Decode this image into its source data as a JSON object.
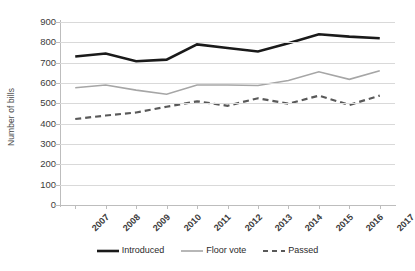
{
  "chart_data": {
    "type": "line",
    "title": "",
    "xlabel": "",
    "ylabel": "Number of bills",
    "categories": [
      "2007",
      "2008",
      "2009",
      "2010",
      "2011",
      "2012",
      "2013",
      "2014",
      "2015",
      "2016",
      "2017"
    ],
    "ylim": [
      0,
      900
    ],
    "ytick_step": 100,
    "yticks": [
      900,
      800,
      700,
      600,
      500,
      400,
      300,
      200,
      100,
      0
    ],
    "grid": true,
    "legend_position": "bottom",
    "series": [
      {
        "name": "Introduced",
        "color": "#1a1a1a",
        "style": "solid",
        "width": 2.6,
        "values": [
          730,
          745,
          707,
          715,
          790,
          772,
          755,
          795,
          840,
          828,
          820
        ]
      },
      {
        "name": "Floor vote",
        "color": "#a6a6a6",
        "style": "solid",
        "width": 1.6,
        "values": [
          577,
          590,
          565,
          545,
          590,
          590,
          588,
          612,
          655,
          618,
          660
        ]
      },
      {
        "name": "Passed",
        "color": "#595959",
        "style": "dashed",
        "width": 2.2,
        "values": [
          423,
          440,
          455,
          483,
          510,
          488,
          525,
          498,
          538,
          492,
          538
        ]
      }
    ]
  },
  "legend": {
    "items": [
      {
        "label": "Introduced"
      },
      {
        "label": "Floor vote"
      },
      {
        "label": "Passed"
      }
    ]
  },
  "axis": {
    "y_title": "Number of bills"
  }
}
